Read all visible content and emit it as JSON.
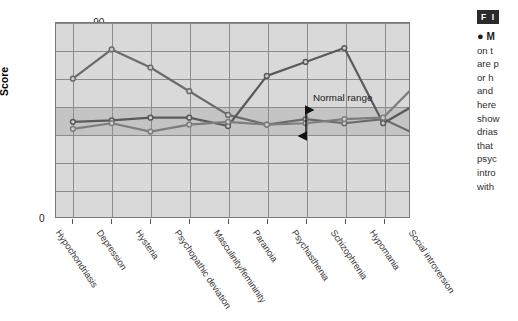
{
  "chart_data": {
    "type": "line",
    "title": "",
    "xlabel": "",
    "ylabel": "Score",
    "ylim": [
      30,
      90
    ],
    "yticks": [
      "0",
      "30",
      "40",
      "50",
      "60",
      "70",
      "80",
      "90"
    ],
    "axis_break": true,
    "grid": true,
    "legend": "none",
    "categories": [
      "Hypochondriasis",
      "Depression",
      "Hysteria",
      "Psychopathic deviation",
      "Masculinity/femininity",
      "Paranoia",
      "Psychasthenia",
      "Schizophrenia",
      "Hypomania",
      "Social introversion"
    ],
    "series": [
      {
        "name": "profile-1",
        "color": "#6b6b6b",
        "values": [
          70,
          80.5,
          74,
          65.5,
          57,
          53.5,
          55.5,
          54,
          55.5,
          49
        ]
      },
      {
        "name": "profile-2",
        "color": "#5a5a5a",
        "values": [
          54.5,
          55,
          56,
          56,
          53,
          71,
          76,
          81,
          54,
          62
        ]
      },
      {
        "name": "profile-3",
        "color": "#7d7d7d",
        "values": [
          52,
          54,
          51,
          53.5,
          54.5,
          53.5,
          54,
          55.5,
          56,
          70
        ]
      }
    ],
    "annotations": [
      {
        "label": "Normal range",
        "from": 50,
        "to": 65
      }
    ],
    "normal_range": {
      "low": 50,
      "high": 65
    }
  },
  "caption": {
    "figure_badge": "F I",
    "lead": "M",
    "lines": [
      "on t",
      "are p",
      "or h",
      "and",
      "here",
      "show",
      "drias",
      "that",
      "psyc",
      "intro",
      "with"
    ]
  }
}
